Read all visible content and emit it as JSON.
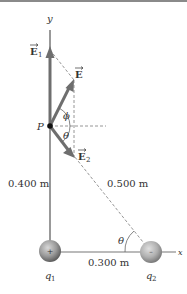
{
  "diagram": {
    "axes": {
      "y_label": "y",
      "x_label": "x"
    },
    "point": {
      "label": "P"
    },
    "vectors": {
      "E1": {
        "symbol": "E",
        "subscript": "1",
        "arrow_glyph": "⃗"
      },
      "E": {
        "symbol": "E",
        "subscript": ""
      },
      "E2": {
        "symbol": "E",
        "subscript": "2"
      }
    },
    "angles": {
      "phi": "ϕ",
      "theta_at_P": "θ",
      "theta_at_q2": "θ"
    },
    "distances": {
      "vertical": "0.400 m",
      "horizontal": "0.300 m",
      "hypotenuse": "0.500 m"
    },
    "charges": {
      "q1": {
        "label": "q",
        "subscript": "1",
        "sign": "+"
      },
      "q2": {
        "label": "q",
        "subscript": "2",
        "sign": "–"
      }
    },
    "colors": {
      "vector": "#6e6e6e",
      "axis": "#777777",
      "dashed": "#8a8a8a",
      "sphere_light": "#c8c8c8",
      "sphere_dark": "#6a6a6a"
    }
  }
}
